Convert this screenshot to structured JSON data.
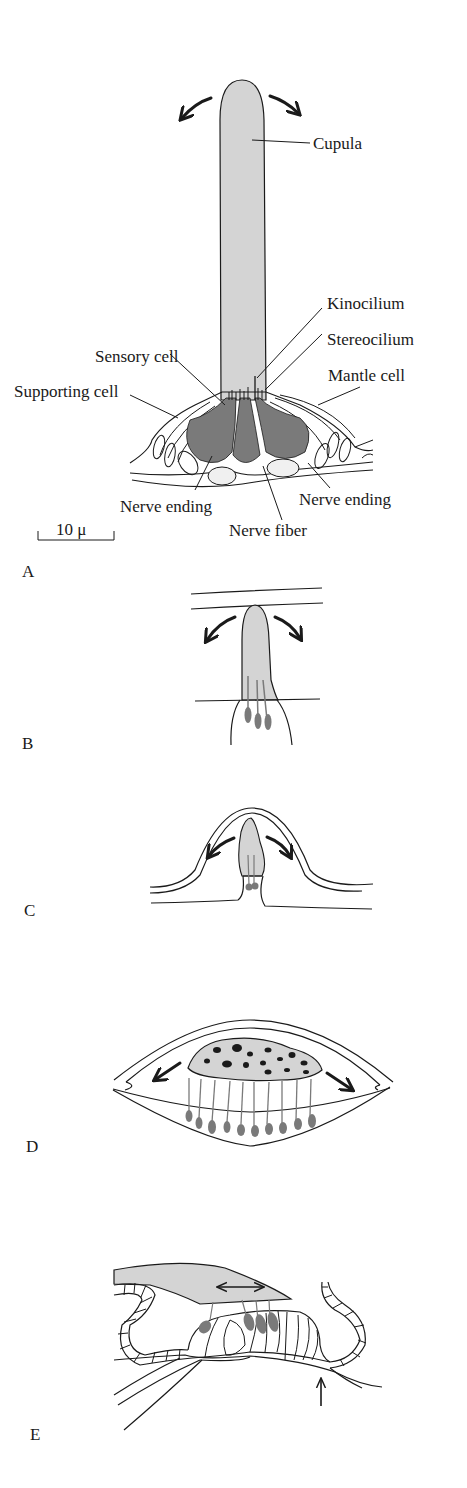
{
  "figure": {
    "colors": {
      "cupula_fill": "#d4d4d4",
      "sensory_cell_fill": "#7a7a7a",
      "line": "#1a1a1a",
      "background": "#ffffff"
    },
    "panels": [
      {
        "id": "A",
        "letter": "A",
        "description": "Neuromast: cupula on sensory epithelium"
      },
      {
        "id": "B",
        "letter": "B",
        "description": "Cupula with three hair cells in canal"
      },
      {
        "id": "C",
        "letter": "C",
        "description": "Cupula under dome-shaped membrane"
      },
      {
        "id": "D",
        "letter": "D",
        "description": "Otolith mass over row of hair cells"
      },
      {
        "id": "E",
        "letter": "E",
        "description": "Tectorial membrane over hair cells"
      }
    ],
    "panel_a": {
      "labels": {
        "cupula": "Cupula",
        "kinocilium": "Kinocilium",
        "stereocilium": "Stereocilium",
        "sensory_cell": "Sensory cell",
        "mantle_cell": "Mantle cell",
        "supporting_cell": "Supporting cell",
        "nerve_ending_left": "Nerve ending",
        "nerve_ending_right": "Nerve ending",
        "nerve_fiber": "Nerve fiber"
      },
      "scale_bar": "10 μ",
      "arrows": [
        "curved-left-arrow",
        "curved-right-arrow"
      ]
    },
    "panel_b": {
      "hair_cells": 3,
      "arrows": [
        "curved-left-arrow",
        "curved-right-arrow"
      ]
    },
    "panel_c": {
      "hair_cells": 2,
      "arrows": [
        "curved-left-arrow",
        "curved-right-arrow"
      ]
    },
    "panel_d": {
      "hair_cells": 10,
      "arrows": [
        "down-left-arrow",
        "down-right-arrow"
      ]
    },
    "panel_e": {
      "hair_cells": 4,
      "arrows": [
        "double-headed-arrow",
        "up-arrow"
      ]
    }
  }
}
